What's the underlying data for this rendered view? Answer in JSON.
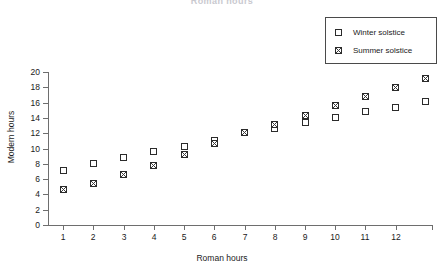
{
  "chart_data": {
    "type": "scatter",
    "title": "Roman hours",
    "xlabel": "Roman hours",
    "ylabel": "Modern hours",
    "xlim": [
      0.5,
      13.2
    ],
    "ylim": [
      0,
      20
    ],
    "grid": false,
    "legend_position": "top-right",
    "x_ticks": [
      1,
      2,
      3,
      4,
      5,
      6,
      7,
      8,
      9,
      10,
      11,
      12
    ],
    "x_tick_labels": [
      "1",
      "2",
      "3",
      "4",
      "5",
      "6",
      "7",
      "8",
      "9",
      "10",
      "11",
      "12"
    ],
    "y_ticks": [
      0,
      2,
      4,
      6,
      8,
      10,
      12,
      14,
      16,
      18,
      20
    ],
    "y_tick_labels": [
      "0",
      "2",
      "4",
      "6",
      "8",
      "10",
      "12",
      "14",
      "16",
      "18",
      "20"
    ],
    "x": [
      1,
      2,
      3,
      4,
      5,
      6,
      7,
      8,
      9,
      10,
      11,
      12,
      13
    ],
    "series": [
      {
        "name": "Winter solstice",
        "marker": "open-square",
        "values": [
          7.1,
          8.0,
          8.8,
          9.6,
          10.3,
          11.1,
          12.1,
          12.6,
          13.4,
          14.1,
          14.8,
          15.4,
          16.1
        ]
      },
      {
        "name": "Summer solstice",
        "marker": "crosshatch-square",
        "values": [
          4.6,
          5.4,
          6.6,
          7.8,
          9.2,
          10.6,
          12.1,
          13.2,
          14.3,
          15.6,
          16.8,
          18.0,
          19.1
        ]
      }
    ]
  },
  "legend": {
    "items": [
      {
        "label": "Winter solstice",
        "marker": "open-square"
      },
      {
        "label": "Summer solstice",
        "marker": "crosshatch-square"
      }
    ]
  },
  "colors": {
    "axis": "#6e6e6e",
    "marker_stroke": "#2b2b2b",
    "marker_fill": "#ffffff",
    "crosshatch": "#3b3b3b",
    "text": "#1a1a1a",
    "title_faded": "#c9c9cf"
  }
}
